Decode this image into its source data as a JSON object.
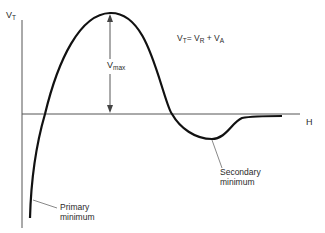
{
  "diagram": {
    "type": "potential-energy-curve",
    "y_axis_label": {
      "main": "V",
      "sub": "T"
    },
    "x_axis_label": "H",
    "equation": {
      "lhs": {
        "main": "V",
        "sub": "T"
      },
      "op1": "=",
      "t1": {
        "main": "V",
        "sub": "R"
      },
      "op2": "+",
      "t2": {
        "main": "V",
        "sub": "A"
      }
    },
    "barrier_label": {
      "main": "V",
      "sub": "max"
    },
    "annotations": [
      {
        "line1": "Primary",
        "line2": "minimum"
      },
      {
        "line1": "Secondary",
        "line2": "minimum"
      }
    ],
    "colors": {
      "curve": "#111111",
      "axis": "#555555",
      "text": "#2a2a2a"
    }
  }
}
